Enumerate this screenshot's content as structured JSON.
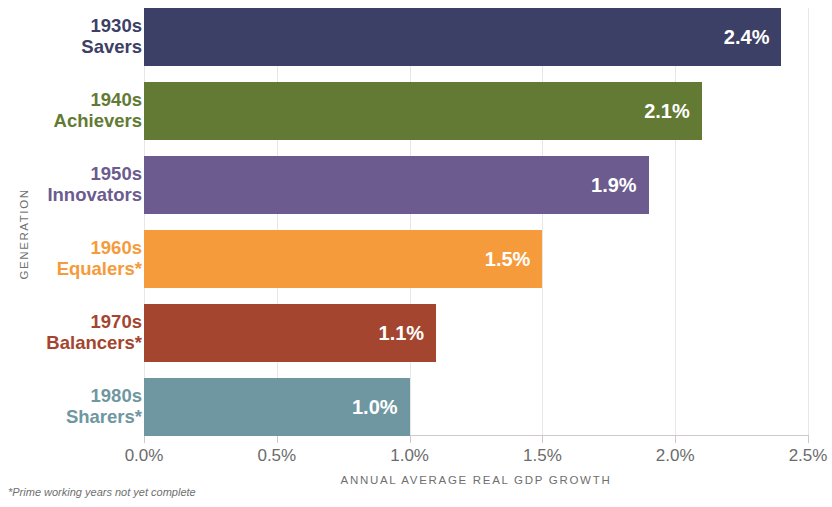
{
  "chart_data": {
    "type": "bar",
    "orientation": "horizontal",
    "title": "",
    "xlabel": "ANNUAL AVERAGE REAL GDP GROWTH",
    "ylabel": "GENERATION",
    "xlim": [
      0,
      2.5
    ],
    "xticks": [
      "0.0%",
      "0.5%",
      "1.0%",
      "1.5%",
      "2.0%",
      "2.5%"
    ],
    "xtick_values": [
      0.0,
      0.5,
      1.0,
      1.5,
      2.0,
      2.5
    ],
    "grid": true,
    "legend": "none",
    "categories": [
      "1930s Savers",
      "1940s Achievers",
      "1950s Innovators",
      "1960s Equalers*",
      "1970s Balancers*",
      "1980s Sharers*"
    ],
    "values": [
      2.4,
      2.1,
      1.9,
      1.5,
      1.1,
      1.0
    ],
    "value_labels": [
      "2.4%",
      "2.1%",
      "1.9%",
      "1.5%",
      "1.1%",
      "1.0%"
    ],
    "colors": [
      "#3d4066",
      "#627a33",
      "#6b5b8e",
      "#f59b3c",
      "#a4452f",
      "#6f97a1"
    ],
    "footnote": "*Prime working years not yet complete"
  },
  "rows": [
    {
      "decade": "1930s",
      "cohort": "Savers",
      "value": 2.4,
      "label": "2.4%",
      "color": "#3d4066"
    },
    {
      "decade": "1940s",
      "cohort": "Achievers",
      "value": 2.1,
      "label": "2.1%",
      "color": "#627a33"
    },
    {
      "decade": "1950s",
      "cohort": "Innovators",
      "value": 1.9,
      "label": "1.9%",
      "color": "#6b5b8e"
    },
    {
      "decade": "1960s",
      "cohort": "Equalers*",
      "value": 1.5,
      "label": "1.5%",
      "color": "#f59b3c"
    },
    {
      "decade": "1970s",
      "cohort": "Balancers*",
      "value": 1.1,
      "label": "1.1%",
      "color": "#a4452f"
    },
    {
      "decade": "1980s",
      "cohort": "Sharers*",
      "value": 1.0,
      "label": "1.0%",
      "color": "#6f97a1"
    }
  ]
}
